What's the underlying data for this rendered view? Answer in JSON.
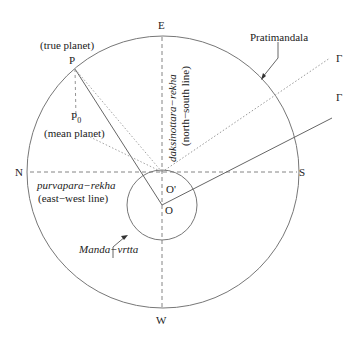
{
  "diagram": {
    "colors": {
      "line": "#666666",
      "text": "#222222",
      "background": "#ffffff"
    },
    "labels": {
      "east": "E",
      "west": "W",
      "north": "N",
      "south": "S",
      "true_planet_caption": "(true planet)",
      "true_planet": "P",
      "mean_planet_symbol": "P",
      "mean_planet_subscript": "0",
      "mean_planet_caption": "(mean planet)",
      "purvapara": "purvapara−rekha",
      "purvapara_caption": "(east−west line)",
      "daksinottara": "daksinottara−rekha",
      "daksinottara_caption": "(north−south line)",
      "pratimandala": "Pratimandala",
      "manda_vrtta": "Manda−vrtta",
      "center_o": "O",
      "center_o_prime": "O'",
      "gamma_dotted": "Γ",
      "gamma_solid": "Γ"
    }
  }
}
